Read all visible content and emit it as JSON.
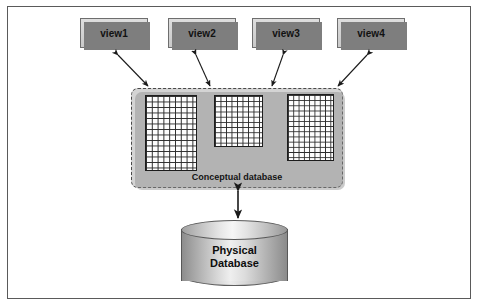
{
  "figure": {
    "background_color": "#ffffff",
    "border_color": "#5a5a5a"
  },
  "views": [
    {
      "id": "view1",
      "label": "view1",
      "x": 80,
      "y": 18,
      "width": 68,
      "height": 30
    },
    {
      "id": "view2",
      "label": "view2",
      "x": 168,
      "y": 18,
      "width": 68,
      "height": 30
    },
    {
      "id": "view3",
      "label": "view3",
      "x": 252,
      "y": 18,
      "width": 68,
      "height": 30
    },
    {
      "id": "view4",
      "label": "view4",
      "x": 337,
      "y": 18,
      "width": 68,
      "height": 30
    }
  ],
  "conceptual": {
    "label": "Conceptual database",
    "fill_color": "#d4d4d4",
    "border_style": "dashed",
    "grids": [
      {
        "id": "grid-1",
        "columns": 9,
        "rows": 14
      },
      {
        "id": "grid-2",
        "columns": 9,
        "rows": 10
      },
      {
        "id": "grid-3",
        "columns": 9,
        "rows": 13
      }
    ]
  },
  "physical": {
    "label_line1": "Physical",
    "label_line2": "Database",
    "shape": "cylinder"
  },
  "connectors": [
    {
      "id": "view1-to-conceptual",
      "type": "double-headed-arrow",
      "from": "view1",
      "to": "conceptual"
    },
    {
      "id": "view2-to-conceptual",
      "type": "double-headed-arrow",
      "from": "view2",
      "to": "conceptual"
    },
    {
      "id": "view3-to-conceptual",
      "type": "double-headed-arrow",
      "from": "view3",
      "to": "conceptual"
    },
    {
      "id": "view4-to-conceptual",
      "type": "double-headed-arrow",
      "from": "view4",
      "to": "conceptual"
    },
    {
      "id": "conceptual-to-physical",
      "type": "double-headed-arrow",
      "from": "conceptual",
      "to": "physical"
    }
  ]
}
